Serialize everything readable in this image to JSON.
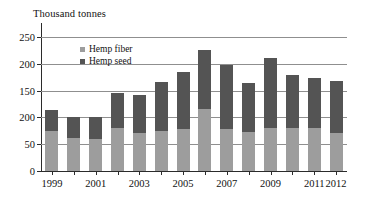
{
  "chart_data": {
    "type": "bar",
    "subtype": "stacked-column",
    "title": "",
    "ylabel": "Thousand tonnes",
    "xlabel": "",
    "ylim": [
      0,
      250
    ],
    "ytick_labels": [
      "250",
      "200",
      "150",
      "200",
      "50",
      "0"
    ],
    "ytick_values": [
      250,
      200,
      150,
      100,
      50,
      0
    ],
    "grid": true,
    "legend_position": "inside-top-left",
    "categories": [
      "1999",
      "2000",
      "2001",
      "2002",
      "2003",
      "2004",
      "2005",
      "2006",
      "2007",
      "2008",
      "2009",
      "2010",
      "2011",
      "2012"
    ],
    "xtick_labels": [
      "1999",
      "2001",
      "2003",
      "2005",
      "2007",
      "2009",
      "2011",
      "2012"
    ],
    "series": [
      {
        "name": "Hemp fiber",
        "color": "#9d9d9d",
        "values": [
          74,
          61,
          59,
          80,
          71,
          74,
          79,
          115,
          78,
          72,
          80,
          81,
          81,
          70
        ]
      },
      {
        "name": "Hemp seed",
        "color": "#545454",
        "values": [
          39,
          40,
          42,
          66,
          71,
          93,
          106,
          111,
          120,
          93,
          130,
          98,
          93,
          98
        ]
      }
    ],
    "totals": [
      213,
      201,
      201,
      146,
      142,
      167,
      185,
      226,
      198,
      165,
      210,
      179,
      174,
      168
    ]
  },
  "legend": {
    "items": [
      {
        "label": "Hemp fiber",
        "color": "#9d9d9d"
      },
      {
        "label": "Hemp seed",
        "color": "#545454"
      }
    ]
  }
}
